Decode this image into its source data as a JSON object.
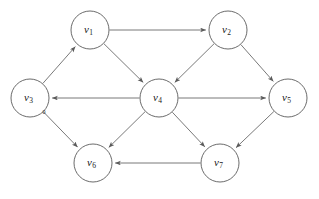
{
  "figure": {
    "kind": "directed-graph",
    "width": 319,
    "height": 199,
    "background": "#ffffff",
    "stroke_color": "#6a6a6a",
    "node_fill": "#ffffff",
    "node_stroke": "#5a5a5a",
    "label_color": "#1a1a1a",
    "node_radius": 19
  },
  "nodes": [
    {
      "id": "v1",
      "base": "v",
      "sub": "1",
      "label": "v₁",
      "cx": 90,
      "cy": 30
    },
    {
      "id": "v2",
      "base": "v",
      "sub": "2",
      "label": "v₂",
      "cx": 228,
      "cy": 30
    },
    {
      "id": "v3",
      "base": "v",
      "sub": "3",
      "label": "v₃",
      "cx": 30,
      "cy": 98
    },
    {
      "id": "v4",
      "base": "v",
      "sub": "4",
      "label": "v₄",
      "cx": 159,
      "cy": 98
    },
    {
      "id": "v5",
      "base": "v",
      "sub": "5",
      "label": "v₅",
      "cx": 288,
      "cy": 98
    },
    {
      "id": "v6",
      "base": "v",
      "sub": "6",
      "label": "v₆",
      "cx": 93,
      "cy": 163
    },
    {
      "id": "v7",
      "base": "v",
      "sub": "7",
      "label": "v₇",
      "cx": 220,
      "cy": 163
    }
  ],
  "edges": [
    {
      "id": "e-v3-v1",
      "from": "v3",
      "to": "v1",
      "directed": true
    },
    {
      "id": "e-v1-v2",
      "from": "v1",
      "to": "v2",
      "directed": true
    },
    {
      "id": "e-v1-v4",
      "from": "v1",
      "to": "v4",
      "directed": true
    },
    {
      "id": "e-v2-v4",
      "from": "v2",
      "to": "v4",
      "directed": true
    },
    {
      "id": "e-v2-v5",
      "from": "v2",
      "to": "v5",
      "directed": true
    },
    {
      "id": "e-v4-v3",
      "from": "v4",
      "to": "v3",
      "directed": true
    },
    {
      "id": "e-v4-v5",
      "from": "v4",
      "to": "v5",
      "directed": true
    },
    {
      "id": "e-v4-v6",
      "from": "v4",
      "to": "v6",
      "directed": true
    },
    {
      "id": "e-v4-v7",
      "from": "v4",
      "to": "v7",
      "directed": true
    },
    {
      "id": "e-v5-v7",
      "from": "v5",
      "to": "v7",
      "directed": true
    },
    {
      "id": "e-v3-v6",
      "from": "v3",
      "to": "v6",
      "directed": true
    },
    {
      "id": "e-v7-v6",
      "from": "v7",
      "to": "v6",
      "directed": true
    }
  ],
  "marks": [
    {
      "id": "mark-v3-zero",
      "text": "0",
      "x": 44,
      "y": 114
    }
  ]
}
